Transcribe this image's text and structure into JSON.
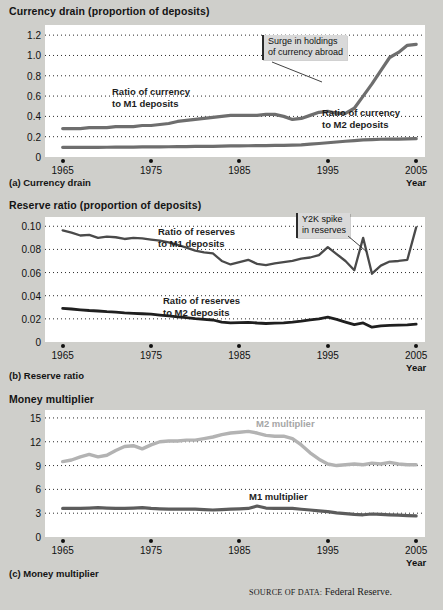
{
  "figure": {
    "source_prefix": "SOURCE OF DATA:",
    "source_value": "Federal Reserve."
  },
  "panels": [
    {
      "key": "currency_drain",
      "axis_title": "Currency drain (proportion of deposits)",
      "caption": "(a) Currency drain",
      "xaxis_label": "Year",
      "callout": {
        "line1": "Surge in holdings",
        "line2": "of currency abroad"
      },
      "labels": [
        {
          "line1": "Ratio of currency",
          "line2": "to M1 deposits"
        },
        {
          "line1": "Ratio of currency",
          "line2": "to M2 deposits"
        }
      ]
    },
    {
      "key": "reserve_ratio",
      "axis_title": "Reserve ratio (proportion of deposits)",
      "caption": "(b) Reserve ratio",
      "xaxis_label": "Year",
      "callout": {
        "line1": "Y2K spike",
        "line2": "in reserves"
      },
      "labels": [
        {
          "line1": "Ratio of reserves",
          "line2": "to M1 deposits"
        },
        {
          "line1": "Ratio of reserves",
          "line2": "to M2 deposits"
        }
      ]
    },
    {
      "key": "money_multiplier",
      "axis_title": "Money multiplier",
      "caption": "(c) Money multiplier",
      "xaxis_label": "Year",
      "labels": [
        {
          "line1": "M2 multiplier"
        },
        {
          "line1": "M1 multiplier"
        }
      ]
    }
  ],
  "chart_data": [
    {
      "type": "line",
      "title": "Currency drain (proportion of deposits)",
      "subtitle": "(a) Currency drain",
      "xlabel": "Year",
      "ylabel": "Currency drain (proportion of deposits)",
      "xlim": [
        1963,
        2006
      ],
      "ylim": [
        0,
        1.3
      ],
      "xticks": [
        1965,
        1975,
        1985,
        1995,
        2005
      ],
      "yticks": [
        0,
        0.2,
        0.4,
        0.6,
        0.8,
        1.0,
        1.2
      ],
      "grid": "horizontal-dotted",
      "legend": "inline-annotations",
      "annotations": [
        {
          "text": "Surge in holdings of currency abroad",
          "points_to_year": 1997
        }
      ],
      "x": [
        1965,
        1966,
        1967,
        1968,
        1969,
        1970,
        1971,
        1972,
        1973,
        1974,
        1975,
        1976,
        1977,
        1978,
        1979,
        1980,
        1981,
        1982,
        1983,
        1984,
        1985,
        1986,
        1987,
        1988,
        1989,
        1990,
        1991,
        1992,
        1993,
        1994,
        1995,
        1996,
        1997,
        1998,
        1999,
        2000,
        2001,
        2002,
        2003,
        2004,
        2005
      ],
      "series": [
        {
          "name": "Ratio of currency to M1 deposits",
          "color": "#6e6e6e",
          "values": [
            0.28,
            0.28,
            0.28,
            0.29,
            0.29,
            0.29,
            0.3,
            0.3,
            0.3,
            0.31,
            0.31,
            0.32,
            0.33,
            0.35,
            0.36,
            0.37,
            0.38,
            0.39,
            0.4,
            0.41,
            0.41,
            0.41,
            0.41,
            0.42,
            0.42,
            0.4,
            0.37,
            0.38,
            0.41,
            0.44,
            0.45,
            0.43,
            0.43,
            0.48,
            0.6,
            0.72,
            0.85,
            0.98,
            1.03,
            1.1,
            1.11
          ]
        },
        {
          "name": "Ratio of currency to M2 deposits",
          "color": "#6e6e6e",
          "values": [
            0.095,
            0.095,
            0.095,
            0.095,
            0.095,
            0.096,
            0.097,
            0.098,
            0.098,
            0.099,
            0.1,
            0.1,
            0.101,
            0.102,
            0.103,
            0.104,
            0.104,
            0.105,
            0.107,
            0.109,
            0.11,
            0.111,
            0.112,
            0.113,
            0.114,
            0.115,
            0.117,
            0.12,
            0.126,
            0.133,
            0.14,
            0.148,
            0.155,
            0.162,
            0.168,
            0.172,
            0.175,
            0.176,
            0.177,
            0.178,
            0.18
          ]
        }
      ]
    },
    {
      "type": "line",
      "title": "Reserve ratio (proportion of deposits)",
      "subtitle": "(b) Reserve ratio",
      "xlabel": "Year",
      "ylabel": "Reserve ratio (proportion of deposits)",
      "xlim": [
        1963,
        2006
      ],
      "ylim": [
        0,
        0.108
      ],
      "xticks": [
        1965,
        1975,
        1985,
        1995,
        2005
      ],
      "yticks": [
        0,
        0.02,
        0.04,
        0.06,
        0.08,
        0.1
      ],
      "grid": "horizontal-dotted",
      "legend": "inline-annotations",
      "annotations": [
        {
          "text": "Y2K spike in reserves",
          "points_to_year": 1999
        }
      ],
      "x": [
        1965,
        1966,
        1967,
        1968,
        1969,
        1970,
        1971,
        1972,
        1973,
        1974,
        1975,
        1976,
        1977,
        1978,
        1979,
        1980,
        1981,
        1982,
        1983,
        1984,
        1985,
        1986,
        1987,
        1988,
        1989,
        1990,
        1991,
        1992,
        1993,
        1994,
        1995,
        1996,
        1997,
        1998,
        1999,
        2000,
        2001,
        2002,
        2003,
        2004,
        2005
      ],
      "series": [
        {
          "name": "Ratio of reserves to M1 deposits",
          "color": "#4a4a4a",
          "values": [
            0.0965,
            0.0945,
            0.092,
            0.0925,
            0.09,
            0.091,
            0.0905,
            0.089,
            0.09,
            0.0895,
            0.0885,
            0.0875,
            0.086,
            0.084,
            0.0815,
            0.079,
            0.0775,
            0.0765,
            0.07,
            0.067,
            0.069,
            0.071,
            0.0675,
            0.0665,
            0.068,
            0.069,
            0.07,
            0.072,
            0.073,
            0.075,
            0.082,
            0.076,
            0.07,
            0.062,
            0.09,
            0.059,
            0.066,
            0.0695,
            0.07,
            0.071,
            0.099
          ]
        },
        {
          "name": "Ratio of reserves to M2 deposits",
          "color": "#1f1f1f",
          "values": [
            0.029,
            0.0285,
            0.0278,
            0.0272,
            0.0268,
            0.0262,
            0.0258,
            0.0252,
            0.0248,
            0.0244,
            0.024,
            0.0232,
            0.0225,
            0.0218,
            0.021,
            0.0202,
            0.0196,
            0.019,
            0.0172,
            0.0165,
            0.0168,
            0.017,
            0.0164,
            0.016,
            0.0163,
            0.0166,
            0.0172,
            0.018,
            0.0192,
            0.02,
            0.0215,
            0.0195,
            0.0172,
            0.015,
            0.0165,
            0.0128,
            0.014,
            0.0144,
            0.0146,
            0.0148,
            0.0155
          ]
        }
      ]
    },
    {
      "type": "line",
      "title": "Money multiplier",
      "subtitle": "(c) Money multiplier",
      "xlabel": "Year",
      "ylabel": "Money multiplier",
      "xlim": [
        1963,
        2006
      ],
      "ylim": [
        0,
        16
      ],
      "xticks": [
        1965,
        1975,
        1985,
        1995,
        2005
      ],
      "yticks": [
        0,
        3,
        6,
        9,
        12,
        15
      ],
      "grid": "horizontal-dotted",
      "legend": "inline-annotations",
      "x": [
        1965,
        1966,
        1967,
        1968,
        1969,
        1970,
        1971,
        1972,
        1973,
        1974,
        1975,
        1976,
        1977,
        1978,
        1979,
        1980,
        1981,
        1982,
        1983,
        1984,
        1985,
        1986,
        1987,
        1988,
        1989,
        1990,
        1991,
        1992,
        1993,
        1994,
        1995,
        1996,
        1997,
        1998,
        1999,
        2000,
        2001,
        2002,
        2003,
        2004,
        2005
      ],
      "series": [
        {
          "name": "M2 multiplier",
          "color": "#b3b3b3",
          "values": [
            9.5,
            9.7,
            10.1,
            10.4,
            10.1,
            10.3,
            10.9,
            11.4,
            11.5,
            11.1,
            11.6,
            12.0,
            12.1,
            12.1,
            12.2,
            12.2,
            12.4,
            12.6,
            12.9,
            13.1,
            13.2,
            13.3,
            13.1,
            12.8,
            12.7,
            12.7,
            12.4,
            11.6,
            10.6,
            9.8,
            9.2,
            9.0,
            9.1,
            9.2,
            9.1,
            9.3,
            9.2,
            9.4,
            9.2,
            9.1,
            9.1
          ]
        },
        {
          "name": "M1 multiplier",
          "color": "#5c5c5c",
          "values": [
            3.6,
            3.6,
            3.6,
            3.65,
            3.7,
            3.65,
            3.6,
            3.6,
            3.65,
            3.7,
            3.6,
            3.55,
            3.5,
            3.5,
            3.5,
            3.5,
            3.45,
            3.4,
            3.45,
            3.5,
            3.55,
            3.6,
            3.9,
            3.65,
            3.6,
            3.6,
            3.6,
            3.5,
            3.4,
            3.3,
            3.2,
            3.05,
            2.95,
            2.85,
            2.8,
            2.9,
            2.85,
            2.8,
            2.75,
            2.7,
            2.65
          ]
        }
      ]
    }
  ]
}
